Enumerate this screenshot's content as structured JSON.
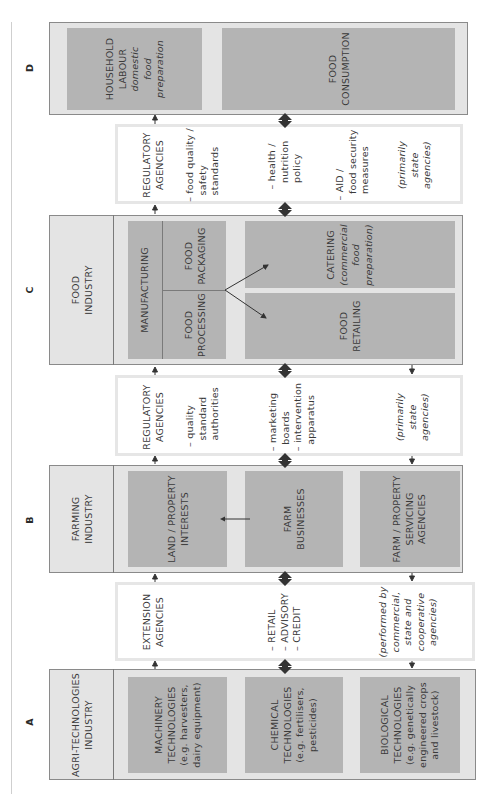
{
  "sections": {
    "A": {
      "letter": "A",
      "label": "AGRI-TECHNOLOGIES\nINDUSTRY",
      "items": [
        {
          "title": "MACHINERY\nTECHNOLOGIES",
          "detail": "(e.g. harvesters,\ndairy equipment)"
        },
        {
          "title": "CHEMICAL\nTECHNOLOGIES",
          "detail": "(e.g. fertilisers,\npesticides)"
        },
        {
          "title": "BIOLOGICAL\nTECHNOLOGIES",
          "detail": "(e.g. genetically\nengineered crops\nand livestock)"
        }
      ]
    },
    "B": {
      "letter": "B",
      "label": "FARMING\nINDUSTRY",
      "items": [
        {
          "title": "LAND / PROPERTY\nINTERESTS"
        },
        {
          "title": "FARM\nBUSINESSES"
        },
        {
          "title": "FARM / PROPERTY\nSERVICING\nAGENCIES"
        }
      ]
    },
    "C": {
      "letter": "C",
      "label": "FOOD\nINDUSTRY",
      "manufacturing": "MANUFACTURING",
      "food_processing": "FOOD\nPROCESSING",
      "food_packaging": "FOOD\nPACKAGING",
      "catering_title": "CATERING",
      "catering_detail": "(commercial\nfood\npreparation)",
      "food_retailing": "FOOD\nRETAILING"
    },
    "D": {
      "letter": "D",
      "household_title": "HOUSEHOLD\nLABOUR",
      "household_detail": "domestic\nfood\npreparation",
      "food_consumption": "FOOD\nCONSUMPTION"
    }
  },
  "agencies": {
    "extension": {
      "title": "EXTENSION\nAGENCIES",
      "functions": "– RETAIL\n– ADVISORY\n– CREDIT",
      "note": "(performed by\ncommercial,\nstate and\ncooperative\nagencies)"
    },
    "regulatory_farming": {
      "title": "REGULATORY\nAGENCIES",
      "item1": "– quality\n  standard\n  authorities",
      "item2": "– marketing\n  boards\n– intervention\n  apparatus",
      "note": "(primarily\nstate\nagencies)"
    },
    "regulatory_food": {
      "title": "REGULATORY\nAGENCIES",
      "item1": "– food quality /\n  safety\n  standards",
      "item2": "– health /\n  nutrition\n  policy",
      "item3": "– AID /\n  food security\n  measures",
      "note": "(primarily\nstate\nagencies)"
    }
  },
  "colors": {
    "outer_box": "#e4e4e4",
    "inner_box": "#b4b4b4",
    "border": "#8a8a8a",
    "arrow": "#333333"
  }
}
